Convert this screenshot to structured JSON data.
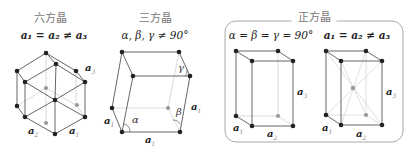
{
  "panels": {
    "hexagonal": {
      "title": "六方晶",
      "relation": "a₁ = a₂ ≠ a₃",
      "labels": {
        "a3": "a",
        "a3_sub": "3",
        "a2": "a",
        "a2_sub": "2",
        "a1": "a",
        "a1_sub": "1"
      }
    },
    "trigonal": {
      "title": "三方晶",
      "relation": "α, β, γ ≠ 90°",
      "labels": {
        "gamma": "γ",
        "beta": "β",
        "alpha": "α",
        "a_right": "a",
        "a_right_sub": "1",
        "a_left": "a",
        "a_left_sub": "1",
        "a_bottom": "a",
        "a_bottom_sub": "1"
      }
    },
    "tetragonal": {
      "title": "正方晶",
      "relation_angles": "α = β = γ = 90°",
      "relation_axes": "a₁ = a₂ ≠ a₃",
      "primitive": {
        "a3": "a",
        "a3_sub": "3",
        "a1": "a",
        "a1_sub": "1",
        "a2": "a",
        "a2_sub": "2"
      },
      "body_centered": {
        "a3": "a",
        "a3_sub": "3",
        "a1": "a",
        "a1_sub": "1",
        "a2": "a",
        "a2_sub": "2"
      }
    }
  },
  "colors": {
    "edge": "#555555",
    "hidden_edge": "#cccccc",
    "atom": "#222222",
    "atom_hidden": "#999999",
    "frame": "#aaaaaa"
  }
}
